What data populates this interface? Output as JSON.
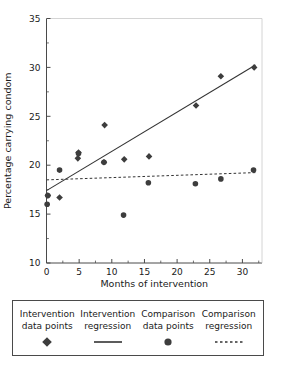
{
  "chart_data": {
    "type": "scatter",
    "title": "",
    "xlabel": "Months of intervention",
    "ylabel": "Percentage carrying condom",
    "xlim": [
      0,
      33
    ],
    "ylim": [
      10,
      35
    ],
    "xticks": [
      0,
      5,
      10,
      15,
      20,
      25,
      30
    ],
    "yticks": [
      10,
      15,
      20,
      25,
      30,
      35
    ],
    "xtick_labels": [
      "0",
      "5",
      "10",
      "15",
      "20",
      "25",
      "30"
    ],
    "ytick_labels": [
      "10",
      "15",
      "20",
      "25",
      "30",
      "35"
    ],
    "x_minor_step": 2.5,
    "y_minor_step": 2.5,
    "grid": false,
    "legend_position": "below-plot",
    "marker_color": "#3d3d3d",
    "line_color": "#333333",
    "axis_color": "#4a4a4a",
    "series": [
      {
        "name": "Intervention data points",
        "marker": "diamond",
        "points": [
          {
            "x": 0.2,
            "y": 16.9
          },
          {
            "x": 2.0,
            "y": 16.7
          },
          {
            "x": 4.8,
            "y": 20.7
          },
          {
            "x": 4.9,
            "y": 21.3
          },
          {
            "x": 8.8,
            "y": 20.3
          },
          {
            "x": 8.9,
            "y": 24.1
          },
          {
            "x": 11.9,
            "y": 20.6
          },
          {
            "x": 15.7,
            "y": 20.9
          },
          {
            "x": 22.9,
            "y": 26.1
          },
          {
            "x": 26.7,
            "y": 29.1
          },
          {
            "x": 31.8,
            "y": 30.0
          }
        ]
      },
      {
        "name": "Comparison data points",
        "marker": "circle",
        "points": [
          {
            "x": 0.1,
            "y": 16.0
          },
          {
            "x": 0.2,
            "y": 16.9
          },
          {
            "x": 2.0,
            "y": 19.5
          },
          {
            "x": 4.9,
            "y": 21.2
          },
          {
            "x": 8.8,
            "y": 20.3
          },
          {
            "x": 11.8,
            "y": 14.9
          },
          {
            "x": 15.6,
            "y": 18.2
          },
          {
            "x": 22.8,
            "y": 18.1
          },
          {
            "x": 26.7,
            "y": 18.6
          },
          {
            "x": 31.7,
            "y": 19.5
          }
        ]
      }
    ],
    "lines": [
      {
        "name": "Intervention regression",
        "style": "solid",
        "x0": 0.0,
        "y0": 17.4,
        "x1": 32.0,
        "y1": 30.25
      },
      {
        "name": "Comparison regression",
        "style": "dashed",
        "x0": 0.0,
        "y0": 18.5,
        "x1": 32.3,
        "y1": 19.25
      }
    ]
  },
  "legend": {
    "entries": [
      {
        "line1": "Intervention",
        "line2": "data points",
        "marker": "diamond-marker"
      },
      {
        "line1": "Intervention",
        "line2": "regression",
        "marker": "solid-line-marker"
      },
      {
        "line1": "Comparison",
        "line2": "data points",
        "marker": "circle-marker"
      },
      {
        "line1": "Comparison",
        "line2": "regression",
        "marker": "dashed-line-marker"
      }
    ]
  }
}
